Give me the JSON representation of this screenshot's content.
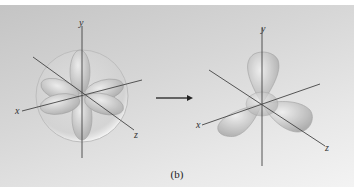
{
  "figure": {
    "caption": "(b)",
    "left_diagram": {
      "description": "sphere enclosing d-orbital lobes (spherical field)",
      "axes": {
        "x": "x",
        "y": "y",
        "z": "z"
      }
    },
    "arrow": {
      "direction": "right"
    },
    "right_diagram": {
      "description": "three lobes along axes (tetrahedral-like splitting)",
      "axes": {
        "x": "x",
        "y": "y",
        "z": "z"
      }
    },
    "colors": {
      "background_top": "#c4c4c4",
      "background_bottom": "#f3f3f3",
      "lobe_fill": "#c8c8c8",
      "axis": "#444444"
    }
  }
}
